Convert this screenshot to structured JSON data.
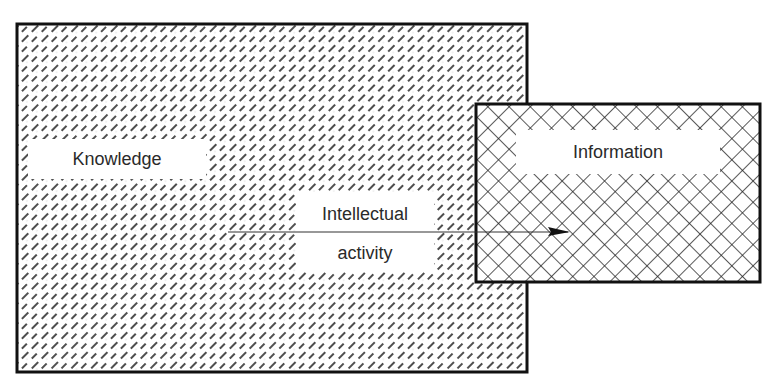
{
  "diagram": {
    "type": "overlapping-regions",
    "regions": [
      {
        "id": "knowledge",
        "label": "Knowledge",
        "fill": "dashed-diagonal-hatch",
        "x": 17,
        "y": 24,
        "width": 510,
        "height": 348
      },
      {
        "id": "information",
        "label": "Information",
        "fill": "cross-hatch",
        "x": 476,
        "y": 104,
        "width": 284,
        "height": 178
      }
    ],
    "arrow": {
      "label_line1": "Intellectual",
      "label_line2": "activity",
      "from": [
        228,
        232
      ],
      "to": [
        570,
        232
      ],
      "direction": "knowledge-to-information"
    },
    "colors": {
      "stroke": "#111111",
      "background": "#ffffff",
      "text": "#2a2a2a"
    }
  }
}
